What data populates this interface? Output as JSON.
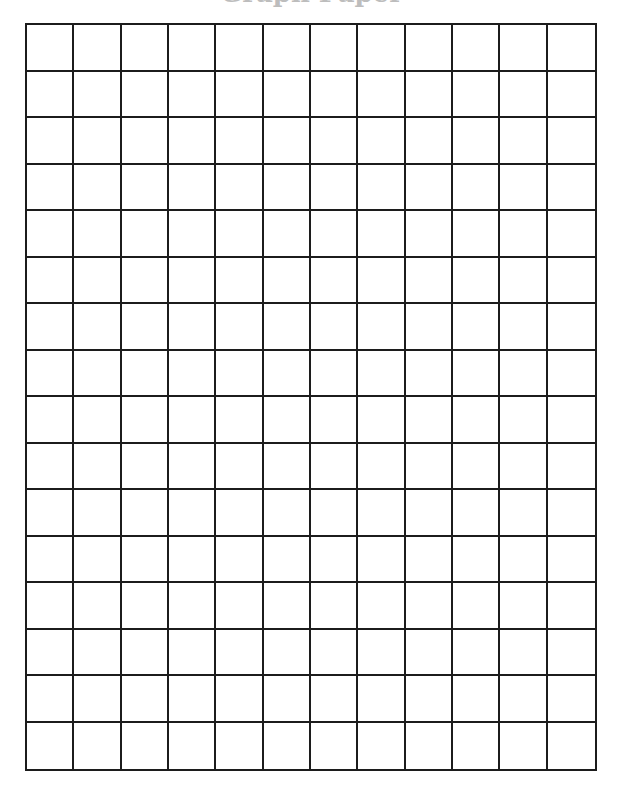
{
  "page": {
    "title": "Graph Paper",
    "title_visible": "clipped-above-viewport"
  },
  "grid": {
    "columns": 12,
    "rows": 16,
    "line_color": "#1c1c1c",
    "background_color": "#ffffff"
  }
}
